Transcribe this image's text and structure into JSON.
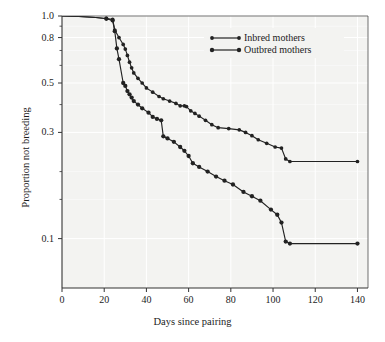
{
  "chart_data": {
    "type": "line",
    "title": "",
    "xlabel": "Days since pairing",
    "ylabel": "Proportion not breeding",
    "xlim": [
      0,
      145
    ],
    "ylim": [
      0.06,
      1.0
    ],
    "yscale": "log",
    "grid": true,
    "legend_position": "top-right",
    "xticks": [
      0,
      20,
      40,
      60,
      80,
      100,
      120,
      140
    ],
    "xtick_labels": [
      "0",
      "20",
      "40",
      "60",
      "80",
      "100",
      "120",
      "140"
    ],
    "yticks": [
      1.0,
      0.8,
      0.5,
      0.3,
      0.1
    ],
    "ytick_labels": [
      "1.0",
      "0.8",
      "0.5",
      "0.3",
      "0.1"
    ],
    "yminor": [
      0.9,
      0.7,
      0.6,
      0.4,
      0.2,
      0.15
    ],
    "series": [
      {
        "name": "Inbred mothers",
        "color": "#222222",
        "points": [
          [
            0,
            1.0
          ],
          [
            8,
            0.995
          ],
          [
            16,
            0.985
          ],
          [
            21,
            0.975
          ],
          [
            24,
            0.965
          ],
          [
            25,
            0.865
          ],
          [
            27,
            0.8
          ],
          [
            29,
            0.745
          ],
          [
            30,
            0.71
          ],
          [
            31,
            0.665
          ],
          [
            32,
            0.62
          ],
          [
            33,
            0.585
          ],
          [
            34,
            0.555
          ],
          [
            36,
            0.525
          ],
          [
            38,
            0.5
          ],
          [
            40,
            0.475
          ],
          [
            43,
            0.455
          ],
          [
            46,
            0.435
          ],
          [
            48,
            0.425
          ],
          [
            51,
            0.415
          ],
          [
            54,
            0.405
          ],
          [
            56,
            0.395
          ],
          [
            58,
            0.395
          ],
          [
            59,
            0.392
          ],
          [
            61,
            0.375
          ],
          [
            63,
            0.365
          ],
          [
            65,
            0.355
          ],
          [
            68,
            0.34
          ],
          [
            71,
            0.325
          ],
          [
            74,
            0.315
          ],
          [
            79,
            0.312
          ],
          [
            84,
            0.308
          ],
          [
            87,
            0.3
          ],
          [
            90,
            0.29
          ],
          [
            93,
            0.278
          ],
          [
            97,
            0.268
          ],
          [
            101,
            0.258
          ],
          [
            104,
            0.255
          ],
          [
            106,
            0.228
          ],
          [
            108,
            0.222
          ],
          [
            140,
            0.222
          ]
        ]
      },
      {
        "name": "Outbred mothers",
        "color": "#222222",
        "points": [
          [
            0,
            1.0
          ],
          [
            8,
            0.995
          ],
          [
            16,
            0.985
          ],
          [
            21,
            0.972
          ],
          [
            24,
            0.955
          ],
          [
            25,
            0.855
          ],
          [
            26,
            0.715
          ],
          [
            27,
            0.64
          ],
          [
            29,
            0.5
          ],
          [
            30,
            0.485
          ],
          [
            31,
            0.46
          ],
          [
            32,
            0.445
          ],
          [
            33,
            0.43
          ],
          [
            34,
            0.415
          ],
          [
            36,
            0.4
          ],
          [
            38,
            0.385
          ],
          [
            41,
            0.368
          ],
          [
            43,
            0.352
          ],
          [
            45,
            0.345
          ],
          [
            47,
            0.34
          ],
          [
            48,
            0.288
          ],
          [
            50,
            0.282
          ],
          [
            53,
            0.272
          ],
          [
            56,
            0.258
          ],
          [
            58,
            0.248
          ],
          [
            60,
            0.235
          ],
          [
            62,
            0.218
          ],
          [
            65,
            0.21
          ],
          [
            69,
            0.2
          ],
          [
            73,
            0.19
          ],
          [
            77,
            0.182
          ],
          [
            81,
            0.175
          ],
          [
            86,
            0.162
          ],
          [
            90,
            0.155
          ],
          [
            94,
            0.148
          ],
          [
            99,
            0.135
          ],
          [
            102,
            0.128
          ],
          [
            104,
            0.118
          ],
          [
            106,
            0.097
          ],
          [
            108,
            0.095
          ],
          [
            140,
            0.095
          ]
        ]
      }
    ]
  },
  "legend": {
    "items": [
      {
        "label": "Inbred mothers"
      },
      {
        "label": "Outbred mothers"
      }
    ]
  }
}
